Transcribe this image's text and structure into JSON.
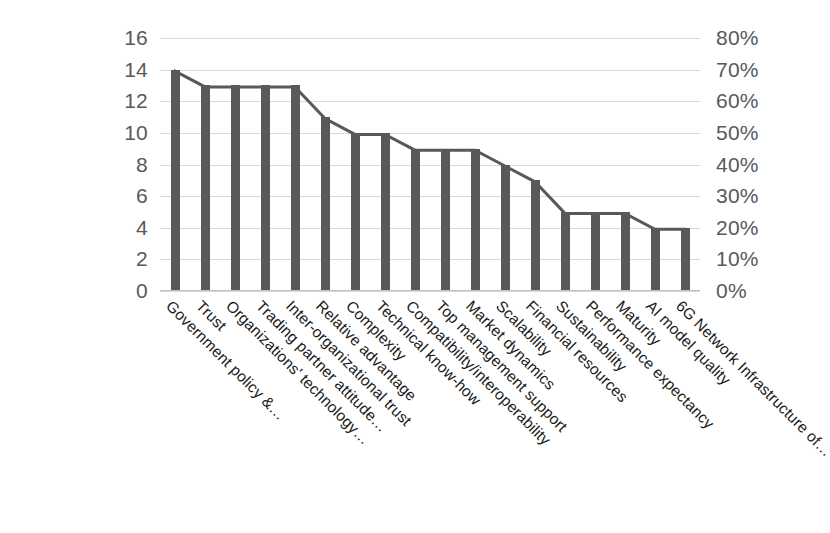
{
  "chart_data": {
    "type": "bar",
    "title": "",
    "subtitle": "",
    "xlabel": "",
    "ylabel": "",
    "grid": true,
    "legend": "none",
    "categories": [
      "Government policy &…",
      "Trust",
      "Organizations' technology…",
      "Trading partner attitude…",
      "Inter-organizational trust",
      "Relative advantage",
      "Complexity",
      "Technical know-how",
      "Compatibility/interoperability",
      "Top management support",
      "Market dynamics",
      "Scalability",
      "Financial resources",
      "Sustainability",
      "Performance expectancy",
      "Maturity",
      "AI model quality",
      "6G Network Infrastructure of…"
    ],
    "series": [
      {
        "name": "Frequency",
        "type": "bar",
        "axis": "left",
        "values": [
          14,
          13,
          13,
          13,
          13,
          11,
          10,
          10,
          9,
          9,
          9,
          8,
          7,
          5,
          5,
          5,
          4,
          4
        ]
      },
      {
        "name": "Line overlay",
        "type": "line",
        "axis": "left",
        "values": [
          14,
          13,
          13,
          13,
          13,
          11,
          10,
          10,
          9,
          9,
          9,
          8,
          7,
          5,
          5,
          5,
          4,
          4
        ]
      }
    ],
    "ylim": [
      0,
      16
    ],
    "ytick_step": 2,
    "yticks": [
      "0",
      "2",
      "4",
      "6",
      "8",
      "10",
      "12",
      "14",
      "16"
    ],
    "y2lim": [
      0,
      80
    ],
    "y2tick_step": 10,
    "y2ticks": [
      "0%",
      "10%",
      "20%",
      "30%",
      "40%",
      "50%",
      "60%",
      "70%",
      "80%"
    ],
    "colors": {
      "bar": "#595959",
      "line": "#595959",
      "grid": "#d9d9d9",
      "axis_text": "#595959",
      "category_text": "#1a1a1a",
      "background": "#ffffff"
    }
  }
}
